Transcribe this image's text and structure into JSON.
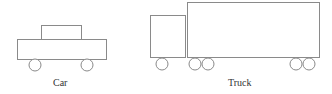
{
  "vehicles": [
    {
      "id": "car",
      "label": "Car"
    },
    {
      "id": "truck",
      "label": "Truck"
    }
  ],
  "colors": {
    "stroke": "#8a8a8a",
    "fill": "#ffffff",
    "text": "#333333"
  }
}
